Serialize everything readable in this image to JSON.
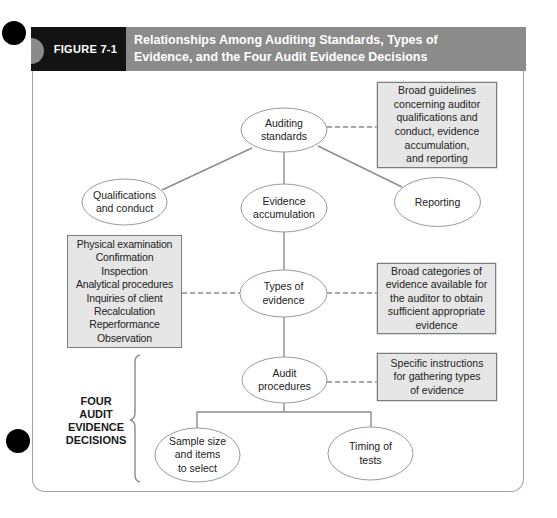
{
  "header": {
    "figure_label": "FIGURE 7-1",
    "title_line1": "Relationships Among Auditing Standards, Types of",
    "title_line2": "Evidence, and the Four Audit Evidence Decisions"
  },
  "nodes": {
    "auditing_standards": "Auditing\nstandards",
    "qualifications": "Qualifications\nand conduct",
    "evidence_accumulation": "Evidence\naccumulation",
    "reporting": "Reporting",
    "types_of_evidence": "Types of\nevidence",
    "audit_procedures": "Audit\nprocedures",
    "sample_size": "Sample size\nand items\nto select",
    "timing": "Timing of\ntests"
  },
  "notes": {
    "auditing_standards_note": "Broad guidelines\nconcerning auditor\nqualifications and\nconduct, evidence\naccumulation,\nand reporting",
    "types_note": "Broad categories of\nevidence available for\nthe auditor to obtain\nsufficient appropriate\nevidence",
    "procedures_note": "Specific instructions\nfor gathering types\nof evidence"
  },
  "evidence_types": [
    "Physical examination",
    "Confirmation",
    "Inspection",
    "Analytical procedures",
    "Inquiries of client",
    "Recalculation",
    "Reperformance",
    "Observation"
  ],
  "decisions_label": "FOUR\nAUDIT\nEVIDENCE\nDECISIONS",
  "colors": {
    "header_dark": "#131313",
    "header_grey": "#8b8b8b",
    "note_fill": "#e6e6e6",
    "line": "#8c8c8c"
  }
}
